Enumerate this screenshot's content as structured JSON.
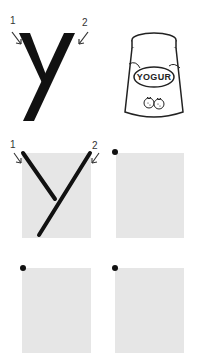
{
  "worksheet": {
    "letter": "y",
    "stroke_numbers": [
      "1",
      "2"
    ],
    "picture": {
      "name": "yogurt",
      "label": "YOGUR"
    },
    "practice_boxes": [
      {
        "id": 1,
        "traced": true,
        "stroke_numbers": [
          "1",
          "2"
        ]
      },
      {
        "id": 2,
        "traced": false,
        "start_dot": true
      },
      {
        "id": 3,
        "traced": false,
        "start_dot": true
      },
      {
        "id": 4,
        "traced": false,
        "start_dot": true
      }
    ],
    "colors": {
      "box_fill": "#e6e6e6",
      "ink": "#111111"
    }
  }
}
